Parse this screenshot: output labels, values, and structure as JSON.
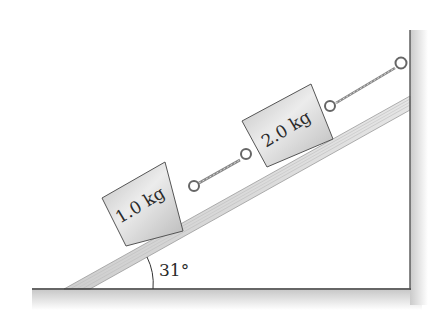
{
  "diagram": {
    "type": "inclined-plane-physics",
    "incline_angle_label": "31°",
    "incline_angle_deg": 31,
    "blocks": [
      {
        "id": "block-1",
        "label": "1.0 kg",
        "mass_kg": 1.0,
        "position": "lower"
      },
      {
        "id": "block-2",
        "label": "2.0 kg",
        "mass_kg": 2.0,
        "position": "upper"
      }
    ],
    "ropes": [
      {
        "from": "block-1",
        "to": "block-2"
      },
      {
        "from": "block-2",
        "to": "wall"
      }
    ],
    "colors": {
      "line": "#333333",
      "block_fill": "#d4d4d4",
      "incline_fill": "#dcdcdc",
      "shadow": "#cfcfcf"
    }
  }
}
